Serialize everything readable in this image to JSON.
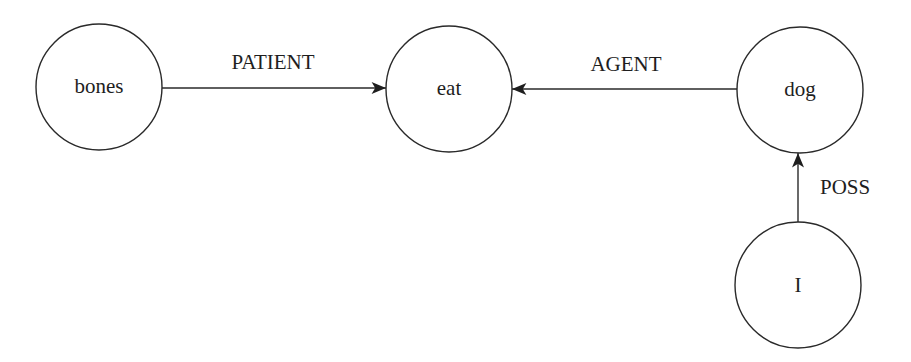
{
  "diagram": {
    "type": "semantic-network",
    "nodes": [
      {
        "id": "bones",
        "label": "bones",
        "cx": 99,
        "cy": 87,
        "r": 63
      },
      {
        "id": "eat",
        "label": "eat",
        "cx": 449,
        "cy": 89,
        "r": 63
      },
      {
        "id": "dog",
        "label": "dog",
        "cx": 800,
        "cy": 90,
        "r": 63
      },
      {
        "id": "I",
        "label": "I",
        "cx": 798,
        "cy": 285,
        "r": 63
      }
    ],
    "edges": [
      {
        "from": "bones",
        "to": "eat",
        "label": "PATIENT"
      },
      {
        "from": "dog",
        "to": "eat",
        "label": "AGENT"
      },
      {
        "from": "I",
        "to": "dog",
        "label": "POSS"
      }
    ]
  }
}
